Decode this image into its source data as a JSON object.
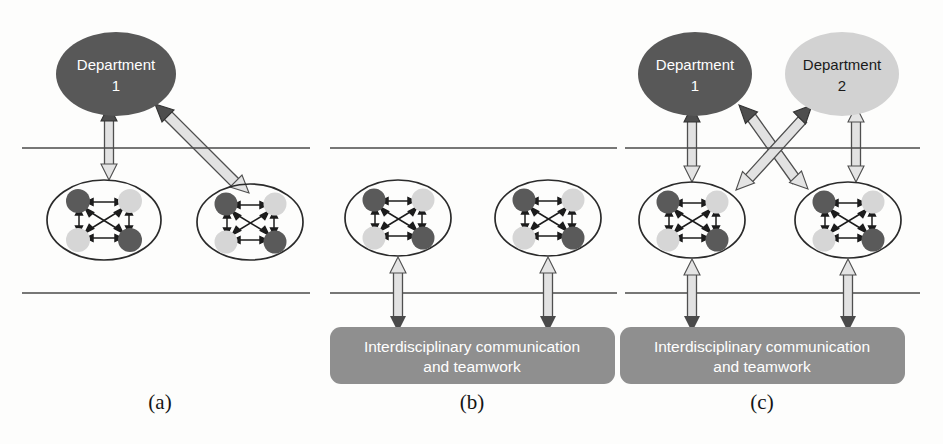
{
  "figure": {
    "background_color": "#fdfdfc"
  },
  "colors": {
    "department_dark": "#585858",
    "department_light": "#d2d2d2",
    "node_dark": "#5a5a5a",
    "node_light": "#d6d6d6",
    "box_fill": "#8f8f8f",
    "box_text": "#ffffff",
    "divider_line": "#4a4a4a",
    "arrow_dark_head": "#4e4e4e",
    "arrow_light_head": "#e4e4e4"
  },
  "panels": [
    {
      "id": "a",
      "caption": "(a)",
      "departments": [
        {
          "id": "a-dept-1",
          "line1": "Department",
          "line2": "1",
          "shade": "dark"
        }
      ],
      "clusters": [
        {
          "id": "a-cluster-left",
          "nodes": [
            "dark",
            "light",
            "light",
            "dark"
          ]
        },
        {
          "id": "a-cluster-right",
          "nodes": [
            "dark",
            "light",
            "light",
            "dark"
          ]
        }
      ],
      "dividers": [
        "upper",
        "lower"
      ],
      "teamwork_box": null,
      "connectors": [
        {
          "from": "a-dept-1",
          "to": "a-cluster-left",
          "style": "vertical-double-block"
        },
        {
          "from": "a-dept-1",
          "to": "a-cluster-right",
          "style": "diagonal-double-block"
        }
      ]
    },
    {
      "id": "b",
      "caption": "(b)",
      "departments": [],
      "clusters": [
        {
          "id": "b-cluster-left",
          "nodes": [
            "dark",
            "light",
            "light",
            "dark"
          ]
        },
        {
          "id": "b-cluster-right",
          "nodes": [
            "dark",
            "light",
            "light",
            "dark"
          ]
        }
      ],
      "dividers": [
        "upper",
        "lower"
      ],
      "teamwork_box": {
        "id": "b-teamwork-box",
        "line1": "Interdisciplinary communication",
        "line2": "and teamwork"
      },
      "connectors": [
        {
          "from": "b-cluster-left",
          "to": "b-teamwork-box",
          "style": "vertical-double-block"
        },
        {
          "from": "b-cluster-right",
          "to": "b-teamwork-box",
          "style": "vertical-double-block"
        }
      ]
    },
    {
      "id": "c",
      "caption": "(c)",
      "departments": [
        {
          "id": "c-dept-1",
          "line1": "Department",
          "line2": "1",
          "shade": "dark"
        },
        {
          "id": "c-dept-2",
          "line1": "Department",
          "line2": "2",
          "shade": "light"
        }
      ],
      "clusters": [
        {
          "id": "c-cluster-left",
          "nodes": [
            "dark",
            "light",
            "light",
            "dark"
          ]
        },
        {
          "id": "c-cluster-right",
          "nodes": [
            "dark",
            "light",
            "light",
            "dark"
          ]
        }
      ],
      "dividers": [
        "upper",
        "lower"
      ],
      "teamwork_box": {
        "id": "c-teamwork-box",
        "line1": "Interdisciplinary communication",
        "line2": "and teamwork"
      },
      "connectors": [
        {
          "from": "c-dept-1",
          "to": "c-cluster-left",
          "style": "vertical-double-block"
        },
        {
          "from": "c-dept-2",
          "to": "c-cluster-right",
          "style": "vertical-double-block"
        },
        {
          "from": "c-dept-1",
          "to": "c-cluster-right",
          "style": "diagonal-double-block"
        },
        {
          "from": "c-dept-2",
          "to": "c-cluster-left",
          "style": "diagonal-double-block"
        },
        {
          "from": "c-cluster-left",
          "to": "c-teamwork-box",
          "style": "vertical-double-block"
        },
        {
          "from": "c-cluster-right",
          "to": "c-teamwork-box",
          "style": "vertical-double-block"
        }
      ]
    }
  ]
}
